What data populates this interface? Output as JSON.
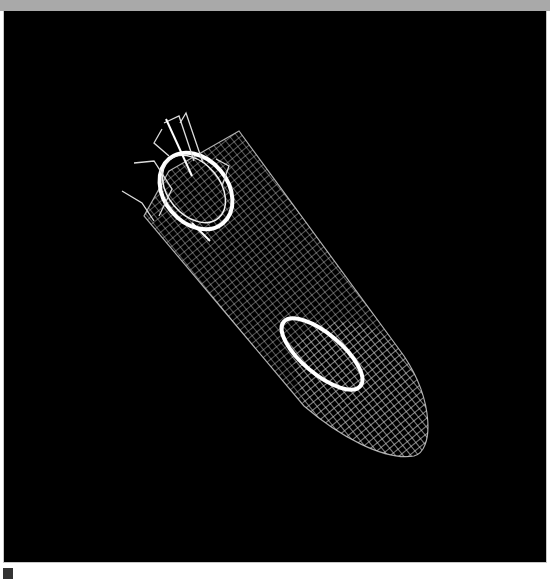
{
  "image": {
    "subject": "wireframe rocket",
    "background_color": "#000000",
    "frame_color": "#a9a9a9",
    "wire_color": "#ffffff"
  },
  "scene": {
    "body": {
      "start": [
        188,
        185
      ],
      "end": [
        380,
        420
      ],
      "radius": 62
    },
    "rings": [
      {
        "name": "rear-ring",
        "cx": 195,
        "cy": 190
      },
      {
        "name": "mid-ring",
        "cx": 320,
        "cy": 345
      }
    ],
    "fins_count": 4
  }
}
